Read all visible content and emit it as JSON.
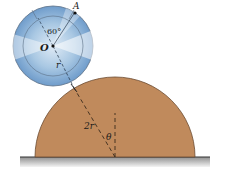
{
  "diagram": {
    "type": "mechanics-figure",
    "labels": {
      "point_a": "A",
      "center_o": "O",
      "angle": "60°",
      "radius": "r",
      "big_radius": "2r",
      "theta": "θ"
    },
    "colors": {
      "mound": "#c08a5c",
      "mound_edge": "#6b4a30",
      "disk_light": "#e6f0f8",
      "disk_mid": "#9cc0de",
      "disk_dark": "#5f8fbf",
      "disk_edge": "#5a6f85",
      "ground": "#a9a9a9",
      "ground_line": "#333333"
    }
  }
}
